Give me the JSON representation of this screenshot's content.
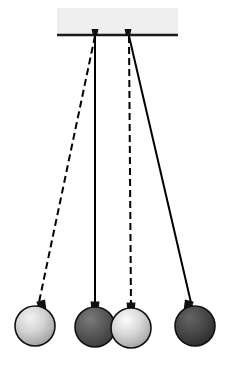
{
  "figure": {
    "title": "Double pendulum collision diagram",
    "width": 228,
    "height": 365,
    "background_color": "#ffffff"
  },
  "ceiling": {
    "label": "ceiling-support-bar",
    "x": 57,
    "y": 8,
    "width": 121,
    "height": 27,
    "fill_color": "#efefef",
    "edge_color": "#1a1a1a",
    "edge_thickness": 2.4
  },
  "pivots": [
    {
      "name": "pivot-left",
      "x": 95,
      "y": 35,
      "cap_color": "#111111",
      "cap_width": 7,
      "cap_height": 6
    },
    {
      "name": "pivot-right",
      "x": 128,
      "y": 35,
      "cap_color": "#111111",
      "cap_width": 7,
      "cap_height": 6
    }
  ],
  "strings": [
    {
      "name": "string-left-displaced",
      "style": "dashed",
      "dash_pattern": "7,4",
      "color": "#000000",
      "width": 2.0,
      "from_pivot": "pivot-left",
      "x1": 95,
      "y1": 36,
      "x2": 38,
      "y2": 307
    },
    {
      "name": "string-left-rest",
      "style": "solid",
      "dash_pattern": "",
      "color": "#000000",
      "width": 2.0,
      "from_pivot": "pivot-left",
      "x1": 95,
      "y1": 36,
      "x2": 95,
      "y2": 308
    },
    {
      "name": "string-right-rest",
      "style": "dashed",
      "dash_pattern": "7,4",
      "color": "#000000",
      "width": 2.0,
      "from_pivot": "pivot-right",
      "x1": 129,
      "y1": 36,
      "x2": 131,
      "y2": 308
    },
    {
      "name": "string-right-displaced",
      "style": "solid",
      "dash_pattern": "",
      "color": "#000000",
      "width": 2.0,
      "from_pivot": "pivot-right",
      "x1": 129,
      "y1": 36,
      "x2": 192,
      "y2": 307
    }
  ],
  "balls": [
    {
      "name": "ball-left-displaced",
      "shade": "light",
      "cx": 35,
      "cy": 326,
      "r": 20,
      "fill_light": "#f2f2f2",
      "fill_mid": "#c9c9c9",
      "fill_dark": "#9a9a9a",
      "outline_color": "#111111",
      "outline_width": 1.6,
      "highlight_x": 30,
      "highlight_y": 318,
      "cap": {
        "x": 42,
        "y": 306,
        "rotation": -14
      }
    },
    {
      "name": "ball-left-rest",
      "shade": "dark",
      "cx": 95,
      "cy": 327,
      "r": 20,
      "fill_light": "#6f6f6f",
      "fill_mid": "#555555",
      "fill_dark": "#383838",
      "outline_color": "#111111",
      "outline_width": 1.6,
      "highlight_x": 90,
      "highlight_y": 319,
      "cap": {
        "x": 95,
        "y": 307,
        "rotation": 0
      }
    },
    {
      "name": "ball-right-rest",
      "shade": "light",
      "cx": 131,
      "cy": 328,
      "r": 20,
      "fill_light": "#fbfbfb",
      "fill_mid": "#cfcfcf",
      "fill_dark": "#9d9d9d",
      "outline_color": "#111111",
      "outline_width": 1.6,
      "highlight_x": 126,
      "highlight_y": 320,
      "cap": {
        "x": 131,
        "y": 308,
        "rotation": 0
      }
    },
    {
      "name": "ball-right-displaced",
      "shade": "dark",
      "cx": 195,
      "cy": 326,
      "r": 20,
      "fill_light": "#5e5e5e",
      "fill_mid": "#464646",
      "fill_dark": "#2b2b2b",
      "outline_color": "#111111",
      "outline_width": 1.6,
      "highlight_x": 190,
      "highlight_y": 318,
      "cap": {
        "x": 188,
        "y": 306,
        "rotation": 14
      }
    }
  ]
}
